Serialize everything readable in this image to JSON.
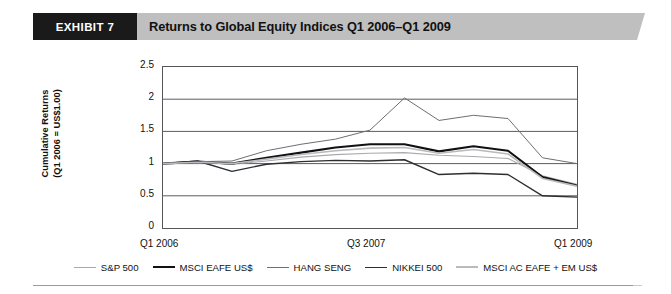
{
  "header": {
    "exhibit_label": "EXHIBIT 7",
    "title": "Returns to Global Equity Indices Q1 2006–Q1 2009"
  },
  "chart_data": {
    "type": "line",
    "title": "Returns to Global Equity Indices Q1 2006–Q1 2009",
    "xlabel": "",
    "ylabel": "Cumulative Returns\n(Q1 2006 = US$1.00)",
    "ylim": [
      0,
      2.5
    ],
    "ytick_labels": [
      "2.5",
      "2",
      "1.5",
      "1",
      "0.5",
      "0"
    ],
    "yticks": [
      2.5,
      2,
      1.5,
      1,
      0.5,
      0
    ],
    "grid": true,
    "legend_position": "bottom",
    "x": [
      "Q1 2006",
      "Q2 2006",
      "Q3 2006",
      "Q4 2006",
      "Q1 2007",
      "Q2 2007",
      "Q3 2007",
      "Q4 2007",
      "Q1 2008",
      "Q2 2008",
      "Q3 2008",
      "Q4 2008",
      "Q1 2009"
    ],
    "xtick_labels": [
      "Q1 2006",
      "Q3 2007",
      "Q1 2009"
    ],
    "xtick_positions": [
      0,
      6,
      12
    ],
    "series": [
      {
        "name": "S&P 500",
        "color": "#a9aaad",
        "width": 1.1,
        "values": [
          1.0,
          1.02,
          0.99,
          1.04,
          1.1,
          1.14,
          1.16,
          1.17,
          1.13,
          1.11,
          1.08,
          0.81,
          0.68
        ]
      },
      {
        "name": "MSCI EAFE US$",
        "color": "#111111",
        "width": 2.1,
        "values": [
          1.0,
          1.03,
          1.0,
          1.09,
          1.17,
          1.25,
          1.3,
          1.3,
          1.19,
          1.27,
          1.2,
          0.79,
          0.66
        ]
      },
      {
        "name": "HANG SENG",
        "color": "#6e6f73",
        "width": 1.0,
        "values": [
          1.0,
          1.03,
          1.04,
          1.2,
          1.3,
          1.38,
          1.52,
          2.02,
          1.67,
          1.75,
          1.7,
          1.09,
          1.0
        ]
      },
      {
        "name": "NIKKEI 500",
        "color": "#2e2f33",
        "width": 1.4,
        "values": [
          1.0,
          1.04,
          0.88,
          0.99,
          1.03,
          1.05,
          1.04,
          1.06,
          0.83,
          0.85,
          0.83,
          0.5,
          0.48
        ]
      },
      {
        "name": "MSCI AC EAFE + EM US$",
        "color": "#b9babd",
        "width": 1.6,
        "values": [
          1.0,
          1.02,
          1.0,
          1.07,
          1.14,
          1.2,
          1.24,
          1.25,
          1.16,
          1.22,
          1.15,
          0.77,
          0.65
        ]
      }
    ]
  }
}
